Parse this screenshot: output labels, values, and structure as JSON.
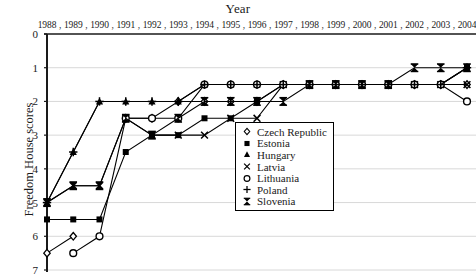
{
  "chart_data": {
    "type": "line",
    "title": "Year",
    "xlabel": "Year",
    "ylabel": "Freedom House scores",
    "categories": [
      "1988",
      "1989",
      "1990",
      "1991",
      "1992",
      "1993",
      "1994",
      "1995",
      "1996",
      "1997",
      "1998",
      "1999",
      "2000",
      "2001",
      "2002",
      "2003",
      "2004"
    ],
    "x": [
      1988,
      1989,
      1990,
      1991,
      1992,
      1993,
      1994,
      1995,
      1996,
      1997,
      1998,
      1999,
      2000,
      2001,
      2002,
      2003,
      2004
    ],
    "ylim": [
      0,
      7
    ],
    "y_inverted": true,
    "yticks": [
      0,
      1,
      2,
      3,
      4,
      5,
      6,
      7
    ],
    "grid": true,
    "legend_position": "center-right",
    "series": [
      {
        "name": "Czech Republic",
        "marker": "diamond",
        "values": [
          6.5,
          6.0,
          null,
          2.5,
          2.5,
          2.0,
          2.0,
          2.0,
          2.0,
          1.5,
          1.5,
          1.5,
          1.5,
          1.5,
          1.5,
          1.5,
          1.5
        ]
      },
      {
        "name": "Estonia",
        "marker": "square",
        "values": [
          5.5,
          5.5,
          5.5,
          3.5,
          3.0,
          3.0,
          2.5,
          2.5,
          2.0,
          1.5,
          1.5,
          1.5,
          1.5,
          1.5,
          1.5,
          1.5,
          1.0
        ]
      },
      {
        "name": "Hungary",
        "marker": "triangle",
        "values": [
          5.0,
          3.5,
          2.0,
          2.0,
          2.0,
          2.0,
          1.5,
          1.5,
          1.5,
          1.5,
          1.5,
          1.5,
          1.5,
          1.5,
          1.5,
          1.5,
          1.0
        ]
      },
      {
        "name": "Latvia",
        "marker": "cross",
        "values": [
          5.0,
          4.5,
          4.5,
          2.5,
          3.0,
          3.0,
          3.0,
          2.5,
          2.5,
          1.5,
          1.5,
          1.5,
          1.5,
          1.5,
          1.5,
          1.5,
          1.5
        ]
      },
      {
        "name": "Lithuania",
        "marker": "circle",
        "values": [
          null,
          6.5,
          6.0,
          2.5,
          2.5,
          2.5,
          1.5,
          1.5,
          1.5,
          1.5,
          1.5,
          1.5,
          1.5,
          1.5,
          1.5,
          1.5,
          2.0
        ]
      },
      {
        "name": "Poland",
        "marker": "plus",
        "values": [
          5.0,
          3.5,
          2.0,
          2.0,
          2.0,
          2.0,
          1.5,
          1.5,
          1.5,
          1.5,
          1.5,
          1.5,
          1.5,
          1.5,
          1.5,
          1.5,
          1.0
        ]
      },
      {
        "name": "Slovenia",
        "marker": "bowtie",
        "values": [
          5.0,
          4.5,
          4.5,
          2.5,
          3.0,
          2.5,
          2.0,
          2.0,
          2.0,
          2.0,
          1.5,
          1.5,
          1.5,
          1.5,
          1.0,
          1.0,
          1.0
        ]
      }
    ],
    "legend_entries": [
      {
        "label": "Czech Republic",
        "marker": "diamond"
      },
      {
        "label": "Estonia",
        "marker": "square"
      },
      {
        "label": "Hungary",
        "marker": "triangle"
      },
      {
        "label": "Latvia",
        "marker": "cross"
      },
      {
        "label": "Lithuania",
        "marker": "circle"
      },
      {
        "label": "Poland",
        "marker": "plus"
      },
      {
        "label": "Slovenia",
        "marker": "bowtie"
      }
    ],
    "colors": {
      "series": "#000000",
      "axis": "#1a1a1a",
      "grid": "#d8d8d8",
      "background": "#ffffff"
    }
  }
}
